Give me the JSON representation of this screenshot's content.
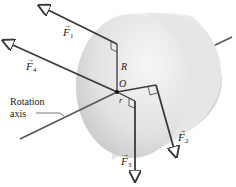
{
  "diagram": {
    "labels": {
      "f1": "F",
      "f1_sub": "1",
      "f2": "F",
      "f2_sub": "2",
      "f3": "F",
      "f3_sub": "3",
      "f4": "F",
      "f4_sub": "4",
      "R": "R",
      "r": "r",
      "O": "O",
      "axis_line1": "Rotation",
      "axis_line2": "axis"
    },
    "colors": {
      "cylinder_light": "#f2f2f2",
      "cylinder_mid": "#d8d8d8",
      "cylinder_dark": "#bdbdbd",
      "line": "#3a3a3a"
    }
  }
}
